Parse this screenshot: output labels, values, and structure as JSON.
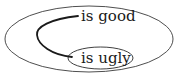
{
  "diagram": {
    "outer_set": {
      "label": "is good"
    },
    "inner_set": {
      "label": "is ugly"
    },
    "connector": "curved-line-linking-inner-to-outer"
  },
  "colors": {
    "background": "#ffffff",
    "stroke": "#1a1a1a",
    "outer_stroke": "#3a3a3a"
  }
}
